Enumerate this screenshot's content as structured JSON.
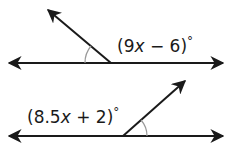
{
  "figure_1": {
    "angle_label": {
      "open": "(",
      "coef": "9",
      "var": "x",
      "op": " − ",
      "const": "6",
      "close": ")",
      "unit": "°"
    }
  },
  "figure_2": {
    "angle_label": {
      "open": "(",
      "coef": "8.5",
      "var": "x",
      "op": " + ",
      "const": "2",
      "close": ")",
      "unit": "°"
    }
  },
  "colors": {
    "line": "#1a1a1a",
    "arc": "#999999"
  }
}
